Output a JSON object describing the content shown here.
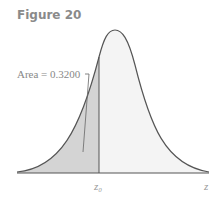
{
  "figure": {
    "title": "Figure 20",
    "area_label": "Area = 0.3200",
    "x_labels": {
      "z0": "z₀",
      "z": "z"
    },
    "colors": {
      "curve": "#555555",
      "shaded": "#d4d4d4",
      "unshaded": "#f4f4f4",
      "text": "#888888"
    }
  }
}
